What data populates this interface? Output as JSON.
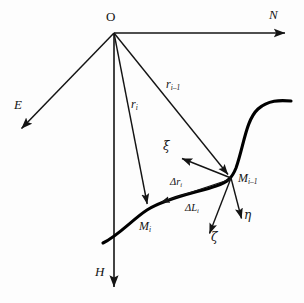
{
  "figure": {
    "background_color": "#fdfdfd",
    "stroke_color": "#141414",
    "curve_color": "#000000",
    "origin": {
      "label": "O",
      "x": 114,
      "y": 33
    },
    "axes": [
      {
        "name": "north-axis",
        "label": "N",
        "from": [
          114,
          33
        ],
        "to": [
          288,
          33
        ],
        "label_pos": [
          271,
          18
        ]
      },
      {
        "name": "east-axis",
        "label": "E",
        "from": [
          114,
          33
        ],
        "to": [
          19,
          131
        ],
        "label_pos": [
          17,
          105
        ]
      },
      {
        "name": "height-axis",
        "label": "H",
        "from": [
          114,
          33
        ],
        "to": [
          114,
          290
        ],
        "label_pos": [
          96,
          271
        ]
      }
    ],
    "vectors": [
      {
        "name": "r-i",
        "label": "r",
        "subscript": "i",
        "from": [
          114,
          33
        ],
        "to": [
          148,
          208
        ],
        "label_pos": [
          133,
          104
        ]
      },
      {
        "name": "r-i-minus-1",
        "label": "r",
        "subscript": "i–1",
        "from": [
          114,
          33
        ],
        "to": [
          230,
          176
        ],
        "label_pos": [
          166,
          84
        ]
      }
    ],
    "points": [
      {
        "name": "point-m-i",
        "label": "M",
        "subscript": "i",
        "x": 147,
        "y": 210,
        "label_pos": [
          140,
          221
        ]
      },
      {
        "name": "point-m-i-minus-1",
        "label": "M",
        "subscript": "i–1",
        "x": 232,
        "y": 178,
        "label_pos": [
          239,
          172
        ]
      }
    ],
    "local_frame": [
      {
        "name": "xi-axis",
        "label": "ξ",
        "from": [
          231,
          178
        ],
        "to": [
          179,
          157
        ],
        "label_pos": [
          164,
          141
        ]
      },
      {
        "name": "eta-axis",
        "label": "η",
        "from": [
          231,
          178
        ],
        "to": [
          243,
          223
        ],
        "label_pos": [
          245,
          210
        ]
      },
      {
        "name": "zeta-axis",
        "label": "ζ",
        "from": [
          231,
          178
        ],
        "to": [
          207,
          238
        ],
        "label_pos": [
          211,
          232
        ]
      }
    ],
    "increments": [
      {
        "name": "delta-r-i",
        "label": "Δr",
        "subscript": "i",
        "from": [
          231,
          179
        ],
        "to": [
          158,
          203
        ],
        "label_pos": [
          171,
          178
        ]
      },
      {
        "name": "delta-l-i",
        "label": "ΔL",
        "subscript": "i",
        "label_pos": [
          186,
          204
        ]
      }
    ],
    "trajectory": {
      "name": "trajectory-curve",
      "description": "thick curve through M_i and M_i-1",
      "path": "M 103,243 C 118,236 133,219 147,210 C 168,197 200,192 216,186 C 228,182 232,178 236,168 C 244,145 246,120 258,109 C 268,100 280,100 291,101"
    }
  }
}
